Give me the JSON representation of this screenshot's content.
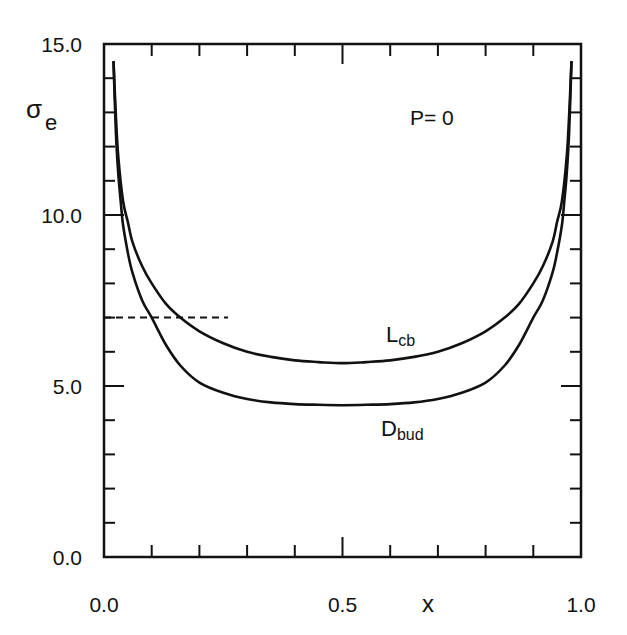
{
  "chart_data": {
    "type": "line",
    "title": "",
    "xlabel": "x",
    "ylabel": "σ",
    "ylabel_subscript": "e",
    "xlim": [
      0.0,
      1.0
    ],
    "ylim": [
      0.0,
      15.0
    ],
    "x_ticks_major": [
      0.0,
      0.5,
      1.0
    ],
    "x_tick_labels": [
      "0.0",
      "0.5",
      "1.0"
    ],
    "x_minor_step": 0.1,
    "y_ticks_major": [
      0.0,
      5.0,
      10.0,
      15.0
    ],
    "y_tick_labels": [
      "0.0",
      "5.0",
      "10.0",
      "15.0"
    ],
    "y_minor_step": 1.0,
    "grid": false,
    "legend": "none",
    "annotations": [
      {
        "text": "P= 0",
        "x": 0.7,
        "y": 13.0
      },
      {
        "text": "L",
        "subscript": "cb",
        "x": 0.675,
        "y": 6.35
      },
      {
        "text": "D",
        "subscript": "bud",
        "x": 0.665,
        "y": 3.75
      }
    ],
    "reference_line": {
      "style": "dashed",
      "y": 7.0,
      "x_start": 0.0,
      "x_end": 0.26
    },
    "series": [
      {
        "name": "L_cb",
        "x": [
          0.02,
          0.025,
          0.03,
          0.04,
          0.05,
          0.06,
          0.08,
          0.1,
          0.13,
          0.16,
          0.2,
          0.25,
          0.3,
          0.35,
          0.4,
          0.45,
          0.5,
          0.55,
          0.6,
          0.65,
          0.7,
          0.75,
          0.8,
          0.84,
          0.87,
          0.9,
          0.92,
          0.94,
          0.95,
          0.96,
          0.97,
          0.975,
          0.98
        ],
        "values": [
          14.5,
          12.9,
          11.7,
          10.4,
          9.8,
          9.2,
          8.5,
          8.0,
          7.4,
          7.0,
          6.6,
          6.25,
          6.0,
          5.85,
          5.75,
          5.7,
          5.67,
          5.7,
          5.75,
          5.85,
          6.0,
          6.25,
          6.6,
          7.0,
          7.4,
          8.0,
          8.5,
          9.2,
          9.8,
          10.4,
          11.7,
          12.9,
          14.5
        ]
      },
      {
        "name": "D_bud",
        "x": [
          0.02,
          0.025,
          0.03,
          0.035,
          0.04,
          0.05,
          0.06,
          0.08,
          0.1,
          0.13,
          0.16,
          0.2,
          0.25,
          0.3,
          0.35,
          0.4,
          0.45,
          0.5,
          0.55,
          0.6,
          0.65,
          0.7,
          0.75,
          0.8,
          0.84,
          0.87,
          0.9,
          0.92,
          0.94,
          0.95,
          0.96,
          0.965,
          0.97,
          0.975,
          0.98
        ],
        "values": [
          14.5,
          12.4,
          11.2,
          10.4,
          9.7,
          8.9,
          8.3,
          7.5,
          7.0,
          6.2,
          5.6,
          5.1,
          4.8,
          4.62,
          4.52,
          4.47,
          4.45,
          4.44,
          4.45,
          4.47,
          4.52,
          4.62,
          4.8,
          5.1,
          5.6,
          6.2,
          7.0,
          7.5,
          8.3,
          8.9,
          9.7,
          10.4,
          11.2,
          12.4,
          14.5
        ]
      }
    ]
  },
  "labels": {
    "y_axis_symbol": "σ",
    "y_axis_sub": "e",
    "x_axis": "x",
    "param": "P= 0",
    "curve1_main": "L",
    "curve1_sub": "cb",
    "curve2_main": "D",
    "curve2_sub": "bud"
  }
}
